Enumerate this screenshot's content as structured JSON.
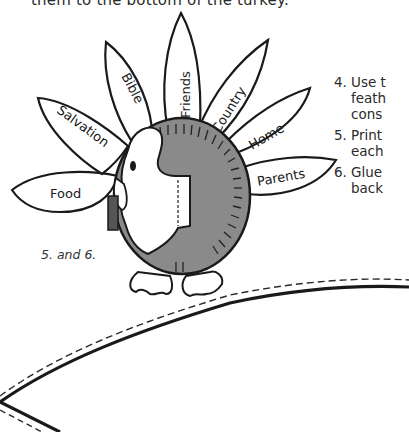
{
  "page": {
    "top_line": "them to the bottom of the turkey."
  },
  "turkey": {
    "feathers": [
      {
        "label": "Food"
      },
      {
        "label": "Salvation"
      },
      {
        "label": "Bible"
      },
      {
        "label": "Friends"
      },
      {
        "label": "Country"
      },
      {
        "label": "Home"
      },
      {
        "label": "Parents"
      }
    ],
    "body_color": "#8a8a8a",
    "outline_color": "#1a1a1a"
  },
  "caption": "5. and 6.",
  "steps": [
    {
      "num": "4.",
      "lines": [
        "Use t",
        "feath",
        "cons"
      ]
    },
    {
      "num": "5.",
      "lines": [
        "Print",
        "each"
      ]
    },
    {
      "num": "6.",
      "lines": [
        "Glue",
        "back"
      ]
    }
  ],
  "pattern": {
    "cut_line": "solid",
    "fold_line": "dashed"
  }
}
